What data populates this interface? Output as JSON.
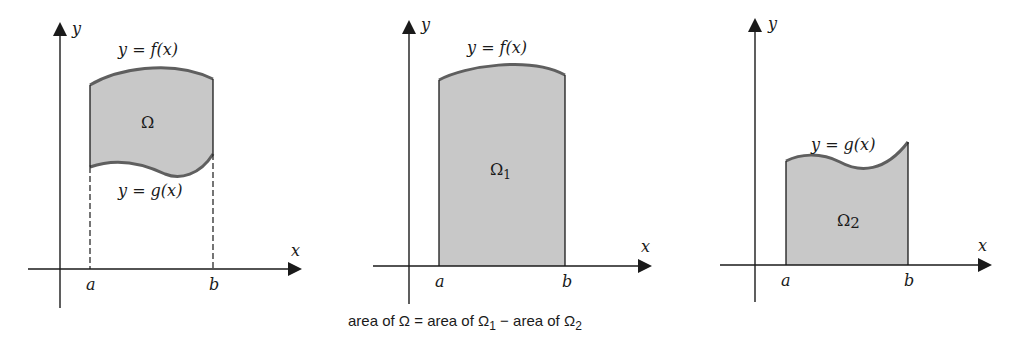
{
  "panels": [
    {
      "id": "omega",
      "axis_x_label": "x",
      "axis_y_label": "y",
      "tick_a": "a",
      "tick_b": "b",
      "upper_curve_label": "y = f(x)",
      "lower_curve_label": "y = g(x)",
      "region_label": "Ω",
      "region_sub": ""
    },
    {
      "id": "omega1",
      "axis_x_label": "x",
      "axis_y_label": "y",
      "tick_a": "a",
      "tick_b": "b",
      "upper_curve_label": "y = f(x)",
      "region_label": "Ω",
      "region_sub": "1"
    },
    {
      "id": "omega2",
      "axis_x_label": "x",
      "axis_y_label": "y",
      "tick_a": "a",
      "tick_b": "b",
      "upper_curve_label": "y = g(x)",
      "region_label": "Ω",
      "region_sub": "2"
    }
  ],
  "caption": {
    "part1": "area of Ω = area of Ω",
    "sub1": "1",
    "part2": " − area of Ω",
    "sub2": "2"
  },
  "colors": {
    "region_fill": "#c8c8c8",
    "curve_stroke": "#5f5f5f",
    "axis_stroke": "#1a1a1a"
  }
}
